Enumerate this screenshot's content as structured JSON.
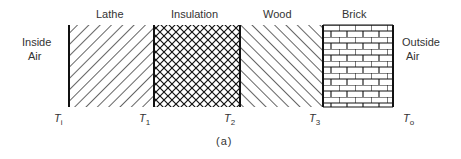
{
  "layers": [
    {
      "name": "Lathe",
      "pattern": "forward-diagonal-hatch"
    },
    {
      "name": "Insulation",
      "pattern": "crosshatch"
    },
    {
      "name": "Wood",
      "pattern": "back-diagonal-hatch"
    },
    {
      "name": "Brick",
      "pattern": "brick"
    }
  ],
  "left_label": [
    "Inside",
    "Air"
  ],
  "right_label": [
    "Outside",
    "Air"
  ],
  "temperatures": [
    {
      "sym": "T",
      "sub": "i"
    },
    {
      "sym": "T",
      "sub": "1"
    },
    {
      "sym": "T",
      "sub": "2"
    },
    {
      "sym": "T",
      "sub": "3"
    },
    {
      "sym": "T",
      "sub": "o"
    }
  ],
  "caption": "(a)"
}
